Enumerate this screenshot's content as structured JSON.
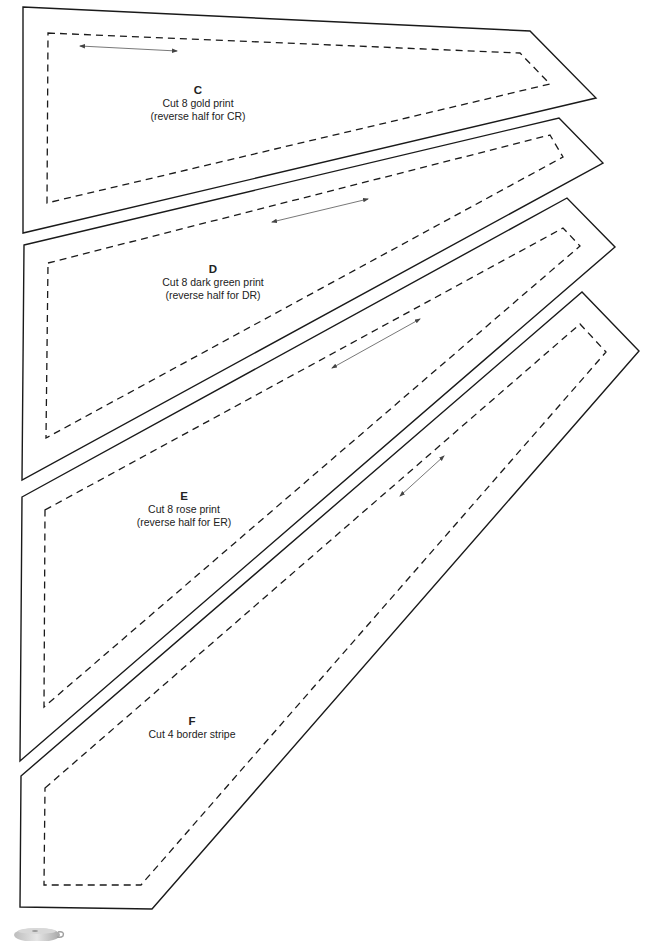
{
  "page": {
    "type": "quilt template pattern sheet",
    "colors": {
      "line": "#1a1a1a",
      "grainline": "#555555",
      "text": "#222222",
      "background": "#ffffff"
    }
  },
  "pieces": [
    {
      "id": "C",
      "letter": "C",
      "instruction": "Cut 8 gold print",
      "note": "(reverse half for CR)",
      "outer": [
        [
          23,
          7
        ],
        [
          530,
          31
        ],
        [
          596,
          98
        ],
        [
          23,
          233
        ]
      ],
      "inner": [
        [
          48,
          33
        ],
        [
          520,
          53
        ],
        [
          550,
          84
        ],
        [
          47,
          203
        ]
      ],
      "grainline": [
        [
          80,
          46
        ],
        [
          177,
          51
        ]
      ],
      "label_pos": [
        198,
        84
      ]
    },
    {
      "id": "D",
      "letter": "D",
      "instruction": "Cut 8 dark green print",
      "note": "(reverse half for DR)",
      "outer": [
        [
          24,
          245
        ],
        [
          559,
          118
        ],
        [
          603,
          163
        ],
        [
          22,
          480
        ]
      ],
      "inner": [
        [
          48,
          263
        ],
        [
          550,
          135
        ],
        [
          563,
          157
        ],
        [
          46,
          438
        ]
      ],
      "grainline": [
        [
          272,
          222
        ],
        [
          368,
          199
        ]
      ],
      "label_pos": [
        213,
        263
      ]
    },
    {
      "id": "E",
      "letter": "E",
      "instruction": "Cut 8 rose print",
      "note": "(reverse half for ER)",
      "outer": [
        [
          22,
          497
        ],
        [
          567,
          198
        ],
        [
          615,
          247
        ],
        [
          20,
          761
        ]
      ],
      "inner": [
        [
          45,
          510
        ],
        [
          563,
          228
        ],
        [
          580,
          246
        ],
        [
          44,
          707
        ]
      ],
      "grainline": [
        [
          332,
          368
        ],
        [
          420,
          319
        ]
      ],
      "label_pos": [
        184,
        490
      ]
    },
    {
      "id": "F",
      "letter": "F",
      "instruction": "Cut 4 border stripe",
      "note": "",
      "outer": [
        [
          21,
          776
        ],
        [
          582,
          292
        ],
        [
          639,
          351
        ],
        [
          152,
          909
        ],
        [
          20,
          907
        ]
      ],
      "inner": [
        [
          45,
          788
        ],
        [
          580,
          324
        ],
        [
          606,
          352
        ],
        [
          141,
          885
        ],
        [
          44,
          885
        ]
      ],
      "grainline": [
        [
          400,
          496
        ],
        [
          444,
          456
        ]
      ],
      "label_pos": [
        192,
        715
      ]
    }
  ],
  "decorations": {
    "teacup_icon": "teacup-icon"
  }
}
